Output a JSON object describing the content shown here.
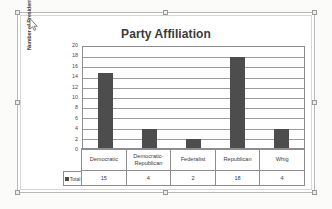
{
  "chart_data": {
    "type": "bar",
    "title": "Party Affiliation",
    "xlabel": "",
    "ylabel": "Number of Presidents",
    "categories": [
      "Democratic",
      "Democratic-Republican",
      "Federalist",
      "Republican",
      "Whig"
    ],
    "category_lines": [
      [
        "Democratic"
      ],
      [
        "Democratic-",
        "Republican"
      ],
      [
        "Federalist"
      ],
      [
        "Republican"
      ],
      [
        "Whig"
      ]
    ],
    "series": [
      {
        "name": "Total",
        "values": [
          15,
          4,
          2,
          18,
          4
        ]
      }
    ],
    "values": [
      15,
      4,
      2,
      18,
      4
    ],
    "ylim": [
      0,
      20
    ],
    "ytick_step": 2,
    "yticks": [
      "20",
      "18",
      "16",
      "14",
      "12",
      "10",
      "8",
      "6",
      "4",
      "2",
      "0"
    ],
    "grid": true,
    "legend_position": "data-table",
    "data_table_visible": true,
    "bar_color": "#4D4D4D",
    "gridline_color": "#9C9C9C",
    "axis_color": "#8D8D8D",
    "title_color": "#3A3A3A",
    "plot_background": "#FFFFFF"
  },
  "chart_object": {
    "selected": true,
    "handle_name": "resize-handle",
    "border_color": "#B9B9B9"
  },
  "cursor": {
    "icon": "mouse-pointer-icon"
  }
}
